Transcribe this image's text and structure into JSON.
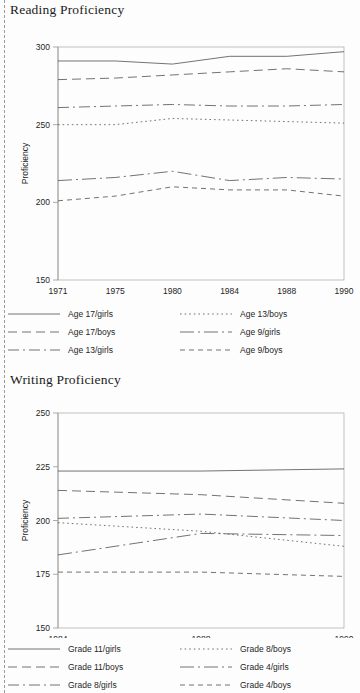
{
  "document": {
    "left_margin_rule": "dashed-perforation"
  },
  "figures": [
    {
      "id": "reading",
      "title": "Reading Proficiency",
      "ylabel": "Proficiency"
    },
    {
      "id": "writing",
      "title": "Writing Proficiency",
      "ylabel": "Proficiency"
    }
  ],
  "chart_data": [
    {
      "type": "line",
      "title": "Reading Proficiency",
      "xlabel": "",
      "ylabel": "Proficiency",
      "categories": [
        "1971",
        "1975",
        "1980",
        "1984",
        "1988",
        "1990"
      ],
      "ylim": [
        150,
        300
      ],
      "yticks": [
        150,
        200,
        250,
        300
      ],
      "grid": false,
      "legend_position": "below",
      "series": [
        {
          "name": "Age 17/girls",
          "dash": "solid",
          "values": [
            291,
            291,
            289,
            294,
            294,
            297
          ]
        },
        {
          "name": "Age 17/boys",
          "dash": "dashed",
          "values": [
            279,
            280,
            282,
            284,
            286,
            284
          ]
        },
        {
          "name": "Age 13/girls",
          "dash": "dashdot",
          "values": [
            261,
            262,
            263,
            262,
            262,
            263
          ]
        },
        {
          "name": "Age 13/boys",
          "dash": "dotted",
          "values": [
            250,
            250,
            254,
            253,
            252,
            251
          ]
        },
        {
          "name": "Age 9/girls",
          "dash": "longdashdot",
          "values": [
            214,
            216,
            220,
            214,
            216,
            215
          ]
        },
        {
          "name": "Age 9/boys",
          "dash": "shortdashed",
          "values": [
            201,
            204,
            210,
            208,
            208,
            204
          ]
        }
      ]
    },
    {
      "type": "line",
      "title": "Writing Proficiency",
      "xlabel": "",
      "ylabel": "Proficiency",
      "categories": [
        "1984",
        "1988",
        "1990"
      ],
      "ylim": [
        150,
        250
      ],
      "yticks": [
        150,
        175,
        200,
        225,
        250
      ],
      "grid": false,
      "legend_position": "below",
      "series": [
        {
          "name": "Grade 11/girls",
          "dash": "solid",
          "values": [
            223,
            223,
            224
          ]
        },
        {
          "name": "Grade 11/boys",
          "dash": "dashed",
          "values": [
            214,
            212,
            208
          ]
        },
        {
          "name": "Grade 8/girls",
          "dash": "dashdot",
          "values": [
            201,
            203,
            200
          ]
        },
        {
          "name": "Grade 8/boys",
          "dash": "dotted",
          "values": [
            199,
            195,
            188
          ]
        },
        {
          "name": "Grade 4/girls",
          "dash": "longdashdot",
          "values": [
            184,
            194,
            193
          ]
        },
        {
          "name": "Grade 4/boys",
          "dash": "shortdashed",
          "values": [
            176,
            176,
            174
          ]
        }
      ]
    }
  ]
}
